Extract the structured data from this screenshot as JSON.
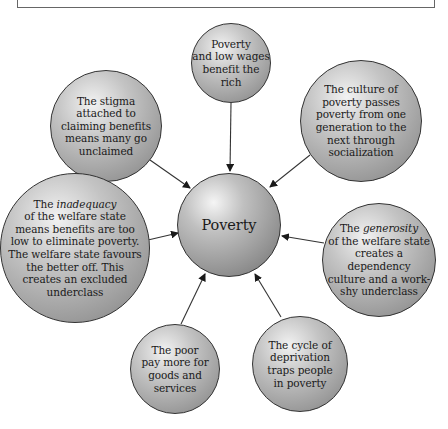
{
  "diagram": {
    "type": "hub-and-spoke",
    "center": {
      "label": "Poverty"
    },
    "nodes": [
      {
        "id": "top",
        "lines": [
          "Poverty",
          "and low wages",
          "benefit the",
          "rich"
        ]
      },
      {
        "id": "top-left",
        "lines": [
          "The stigma",
          "attached to",
          "claiming benefits",
          "means many go",
          "unclaimed"
        ]
      },
      {
        "id": "top-right",
        "lines": [
          "The culture of",
          "poverty passes",
          "poverty from one",
          "generation to the",
          "next through",
          "socialization"
        ]
      },
      {
        "id": "left",
        "prefix": "The ",
        "emphasis": "inadequacy",
        "lines": [
          "of the welfare state",
          "means benefits are too",
          "low to eliminate poverty.",
          "The welfare state favours",
          "the better off. This",
          "creates an excluded",
          "underclass"
        ]
      },
      {
        "id": "right",
        "prefix": "The ",
        "emphasis": "generosity",
        "lines": [
          "of the welfare state",
          "creates a dependency",
          "culture and a work-",
          "shy underclass"
        ]
      },
      {
        "id": "bottom-left",
        "lines": [
          "The poor",
          "pay more for",
          "goods and",
          "services"
        ]
      },
      {
        "id": "bottom-right",
        "lines": [
          "The cycle of",
          "deprivation",
          "traps people",
          "in poverty"
        ]
      }
    ],
    "arrow_direction": "toward-center"
  },
  "colors": {
    "stroke": "#333333",
    "text": "#1a1a1a",
    "fill_light": "#f2f2f2",
    "fill_dark": "#7a7a7a"
  }
}
